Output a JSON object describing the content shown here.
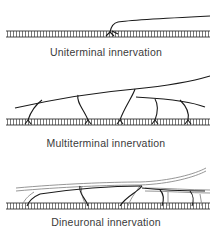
{
  "colors": {
    "ink": "#1a1a1a",
    "grey_nerve": "#9a9a9a",
    "label": "#3a3a3a",
    "background": "#ffffff"
  },
  "panels": [
    {
      "id": "uniterminal",
      "label": "Uniterminal innervation",
      "endplates": 1
    },
    {
      "id": "multiterminal",
      "label": "Multiterminal innervation",
      "endplates": 5
    },
    {
      "id": "dineuronal",
      "label": "Dineuronal innervation",
      "neurons": 2
    }
  ]
}
